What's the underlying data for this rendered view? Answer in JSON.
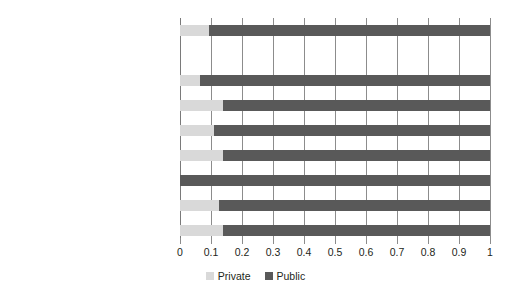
{
  "chart_data": {
    "type": "bar",
    "orientation": "horizontal",
    "stacked": true,
    "normalized": true,
    "title": "",
    "subtitle": "",
    "xlabel": "",
    "ylabel": "",
    "xlim": [
      0,
      1
    ],
    "grid": true,
    "legend_position": "bottom",
    "xticks": [
      "0",
      "0.1",
      "0.2",
      "0.3",
      "0.4",
      "0.5",
      "0.6",
      "0.7",
      "0.8",
      "0.9",
      "1"
    ],
    "xtick_values": [
      0,
      0.1,
      0.2,
      0.3,
      0.4,
      0.5,
      0.6,
      0.7,
      0.8,
      0.9,
      1
    ],
    "categories": [
      "World",
      "East Asia",
      "Europe and Central Asia",
      "Latin America",
      "Middle East and Northern Africa",
      "South Asia",
      "Sub-Saharan Africa",
      "High income countries"
    ],
    "series": [
      {
        "name": "Private",
        "color": "#d9d9d9",
        "values": [
          0.095,
          0.065,
          0.14,
          0.11,
          0.14,
          0.0,
          0.125,
          0.14
        ]
      },
      {
        "name": "Public",
        "color": "#595959",
        "values": [
          0.905,
          0.935,
          0.86,
          0.89,
          0.86,
          1.0,
          0.875,
          0.86
        ]
      }
    ]
  },
  "legend": {
    "items": [
      {
        "label": "Private",
        "color": "#d9d9d9"
      },
      {
        "label": "Public",
        "color": "#595959"
      }
    ]
  }
}
